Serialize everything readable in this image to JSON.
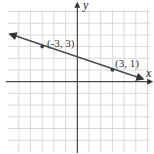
{
  "diagram": {
    "type": "coordinate-plane-line",
    "axes": {
      "x_label": "x",
      "y_label": "y"
    },
    "points": [
      {
        "label": "(-3, 3)",
        "x": -3,
        "y": 3
      },
      {
        "label": "(3, 1)",
        "x": 3,
        "y": 1
      }
    ],
    "line": {
      "slope": "-1/3",
      "y_intercept": 2
    },
    "grid": {
      "x_range": [
        -5,
        6
      ],
      "y_range": [
        -5,
        6
      ],
      "spacing": 1
    },
    "colors": {
      "grid": "#c8c8c8",
      "axes": "#222222",
      "line": "#4a4a4a"
    }
  }
}
